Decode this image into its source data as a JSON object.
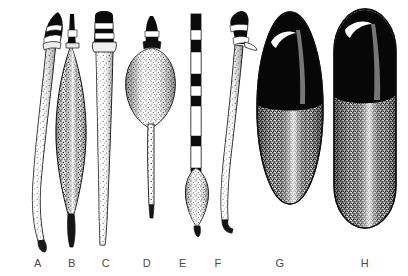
{
  "plate": {
    "title": "Plate of elongated specimens A through H",
    "background_color": "#ffffff",
    "ink_color": "#111111",
    "label_color": "#4a4a4a",
    "style": "black-ink stipple line drawing",
    "width": 408,
    "height": 276
  },
  "specimens": [
    {
      "label": "A",
      "label_x": 38,
      "label_y": 267,
      "shape": "slender curved tapering shaft",
      "head": "dark conical cap with two white binding bands",
      "body": "long sigmoid curved shaft, stipple-shaded on left edge",
      "tip": "narrow pointed lower tip",
      "axis_x": 45,
      "top_y": 12,
      "bottom_y": 243,
      "max_width": 14
    },
    {
      "label": "B",
      "label_x": 72,
      "label_y": 267,
      "shape": "fusiform spindle",
      "head": "narrow dark spike with single white band",
      "body": "leaf-shaped swollen midsection, dense stipple",
      "tip": "tapering straight lower point",
      "axis_x": 71,
      "top_y": 14,
      "bottom_y": 245,
      "max_width": 26
    },
    {
      "label": "C",
      "label_x": 106,
      "label_y": 267,
      "shape": "straight tapering blade",
      "head": "dark cylindrical socket with white lashing bands",
      "body": "long straight taper, stipple-shaded right side",
      "tip": "fine pointed lower tip",
      "axis_x": 105,
      "top_y": 13,
      "bottom_y": 247,
      "max_width": 18
    },
    {
      "label": "D",
      "label_x": 147,
      "label_y": 267,
      "shape": "bulbous teardrop with tail",
      "head": "small dark conical cap with white band",
      "body": "broad ovoid bulb, stipple-shaded at margins",
      "tip": "long slender straight tail",
      "axis_x": 152,
      "top_y": 16,
      "bottom_y": 215,
      "max_width": 40
    },
    {
      "label": "E",
      "label_x": 183,
      "label_y": 267,
      "shape": "banded rod with lower bulb",
      "head": "dark narrow rod top",
      "body": "alternating dark and white bands along straight shaft",
      "tip": "small spindle bulb at lower end with short point",
      "axis_x": 195,
      "top_y": 14,
      "bottom_y": 235,
      "max_width": 22
    },
    {
      "label": "F",
      "label_x": 218,
      "label_y": 267,
      "shape": "curved hooked implement",
      "head": "dark hooked cap with white band and side barb",
      "body": "gently curved stippled shaft",
      "tip": "recurved lower tip",
      "axis_x": 230,
      "top_y": 12,
      "bottom_y": 225,
      "max_width": 20
    },
    {
      "label": "G",
      "label_x": 280,
      "label_y": 267,
      "shape": "large ovoid",
      "head": "solid dark cap over upper third with white crescent highlight",
      "body": "heavily stippled ovoid body with pale central highlight",
      "tip": "rounded base",
      "axis_x": 290,
      "top_y": 10,
      "bottom_y": 205,
      "max_width": 66
    },
    {
      "label": "H",
      "label_x": 365,
      "label_y": 267,
      "shape": "large rounded cylinder",
      "head": "solid dark cap with white crescent highlight",
      "body": "stippled cylindrical body with vertical pale highlight",
      "tip": "rounded flat base",
      "axis_x": 365,
      "top_y": 8,
      "bottom_y": 228,
      "max_width": 62
    }
  ],
  "labels_row": {
    "name": "specimen-labels",
    "items": [
      "A",
      "B",
      "C",
      "D",
      "E",
      "F",
      "G",
      "H"
    ]
  }
}
